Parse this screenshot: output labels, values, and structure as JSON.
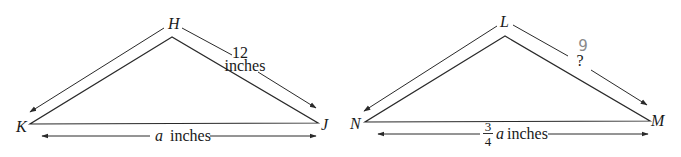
{
  "diagram": {
    "triangle_left": {
      "vertices": {
        "top": "H",
        "left": "K",
        "right": "J"
      },
      "side_HJ": {
        "value": "12",
        "unit": "inches"
      },
      "side_KJ": {
        "variable": "a",
        "unit": "inches"
      }
    },
    "triangle_right": {
      "vertices": {
        "top": "L",
        "left": "N",
        "right": "M"
      },
      "side_LM": {
        "value": "?",
        "handwritten_answer": "9"
      },
      "side_NM": {
        "frac_num": "3",
        "frac_den": "4",
        "variable": "a",
        "unit": "inches"
      }
    },
    "colors": {
      "ink": "#2a2a2a",
      "pencil": "#8a8a8a"
    }
  }
}
